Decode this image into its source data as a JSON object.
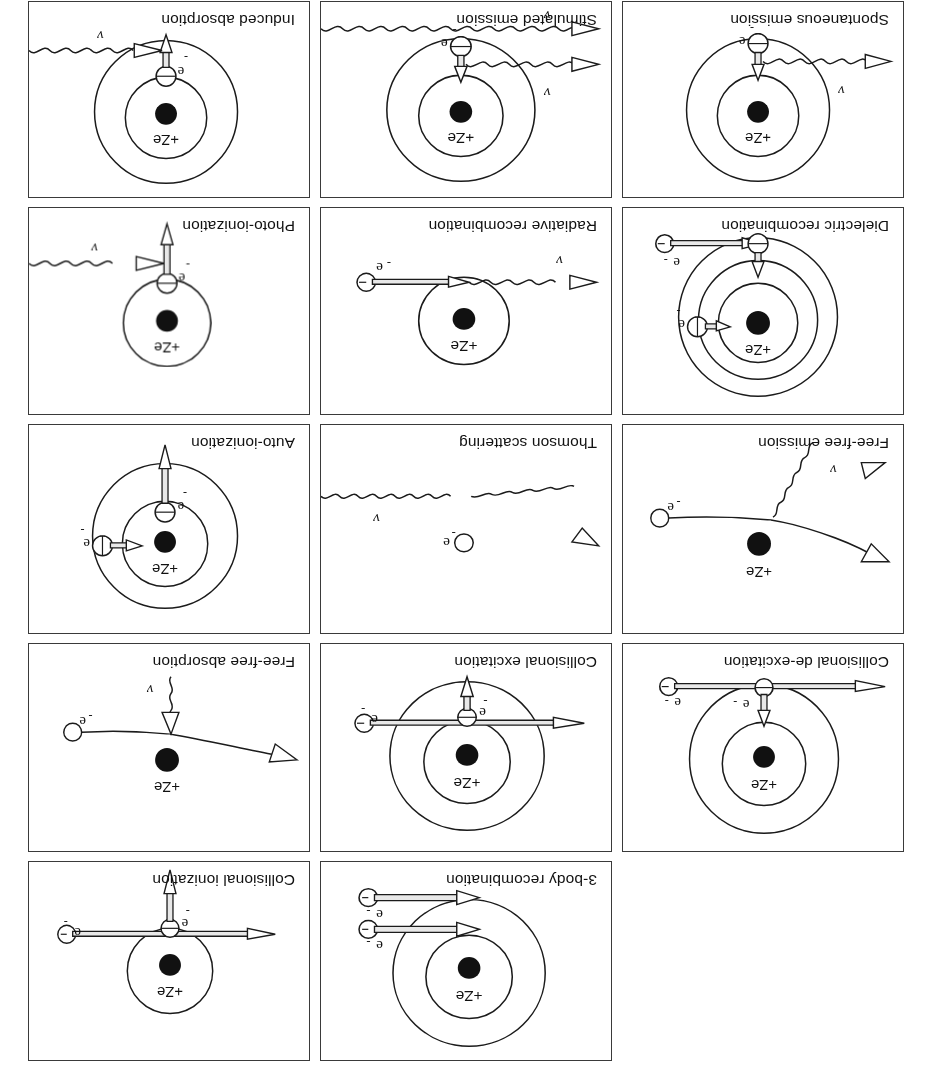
{
  "figure": {
    "orientation_degrees": 180,
    "grid": {
      "columns": 3,
      "rows": 5
    },
    "nucleus_label": "+Ze",
    "electron_label": "e",
    "electron_charge_label": "-",
    "photon_label": "v",
    "colors": {
      "ink": "#1b1b1b",
      "panel_border": "#3a3a3a",
      "background": "#ffffff",
      "nucleus_fill": "#111111",
      "shaft_fill": "#e8e8e8"
    }
  },
  "panels": [
    {
      "id": "empty-cell",
      "label": "",
      "empty": true
    },
    {
      "id": "three-body-recombination",
      "label": "3-body recombination"
    },
    {
      "id": "collisional-ionization",
      "label": "Collisional ionization"
    },
    {
      "id": "collisional-de-excitation",
      "label": "Collisional de-excitation"
    },
    {
      "id": "collisional-excitation",
      "label": "Collisional excitation"
    },
    {
      "id": "free-free-absorption",
      "label": "Free-free absorption"
    },
    {
      "id": "free-free-emission",
      "label": "Free-free emission"
    },
    {
      "id": "thomson-scattering",
      "label": "Thomson scattering"
    },
    {
      "id": "auto-ionization",
      "label": "Auto-ionization"
    },
    {
      "id": "dielectric-recombination",
      "label": "Dielectric recombination"
    },
    {
      "id": "radiative-recombination",
      "label": "Radiative recombination"
    },
    {
      "id": "photo-ionization",
      "label": "Photo-ionization"
    },
    {
      "id": "spontaneous-emission",
      "label": "Spontaneous emission"
    },
    {
      "id": "stimulated-emission",
      "label": "Stimulated emission"
    },
    {
      "id": "induced-absorption",
      "label": "Induced absorption"
    }
  ]
}
